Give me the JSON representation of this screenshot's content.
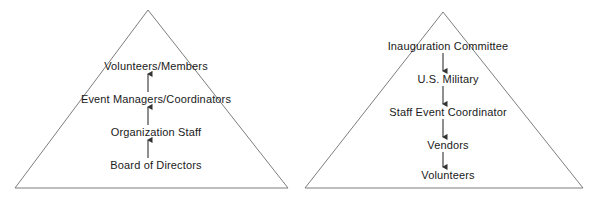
{
  "diagram": {
    "type": "pyramid-hierarchy-pair",
    "background_color": "#ffffff",
    "line_color": "#7d7d7d",
    "arrow_color": "#333333",
    "text_color": "#1a1a1a"
  },
  "pyramids": [
    {
      "id": "organization-pyramid",
      "name": "Organization Volunteer Hierarchy",
      "apex": {
        "x": 148,
        "y": 10
      },
      "base_left": {
        "x": 15,
        "y": 188
      },
      "base_right": {
        "x": 288,
        "y": 188
      },
      "flow_direction": "upward",
      "arrow_glyph": "up-arrow",
      "levels": [
        {
          "label": "Volunteers/Members",
          "x": 156,
          "y": 66
        },
        {
          "label": "Event Managers/Coordinators",
          "x": 156,
          "y": 99
        },
        {
          "label": "Organization Staff",
          "x": 156,
          "y": 132
        },
        {
          "label": "Board of Directors",
          "x": 156,
          "y": 165
        }
      ],
      "arrows": [
        {
          "x": 148,
          "y_from": 92,
          "y_to": 73,
          "direction": "up"
        },
        {
          "x": 148,
          "y_from": 125,
          "y_to": 106,
          "direction": "up"
        },
        {
          "x": 148,
          "y_from": 158,
          "y_to": 139,
          "direction": "up"
        }
      ]
    },
    {
      "id": "inauguration-pyramid",
      "name": "Inauguration Committee Hierarchy",
      "apex": {
        "x": 443,
        "y": 12
      },
      "base_left": {
        "x": 305,
        "y": 188
      },
      "base_right": {
        "x": 583,
        "y": 188
      },
      "flow_direction": "downward",
      "arrow_glyph": "down-arrow",
      "levels": [
        {
          "label": "Inauguration Committee",
          "x": 448,
          "y": 46
        },
        {
          "label": "U.S. Military",
          "x": 448,
          "y": 79
        },
        {
          "label": "Staff Event Coordinator",
          "x": 448,
          "y": 112
        },
        {
          "label": "Vendors",
          "x": 448,
          "y": 145
        },
        {
          "label": "Volunteers",
          "x": 448,
          "y": 175
        }
      ],
      "arrows": [
        {
          "x": 443,
          "y_from": 53,
          "y_to": 72,
          "direction": "down"
        },
        {
          "x": 443,
          "y_from": 86,
          "y_to": 105,
          "direction": "down"
        },
        {
          "x": 443,
          "y_from": 119,
          "y_to": 138,
          "direction": "down"
        },
        {
          "x": 443,
          "y_from": 152,
          "y_to": 168,
          "direction": "down"
        }
      ]
    }
  ]
}
